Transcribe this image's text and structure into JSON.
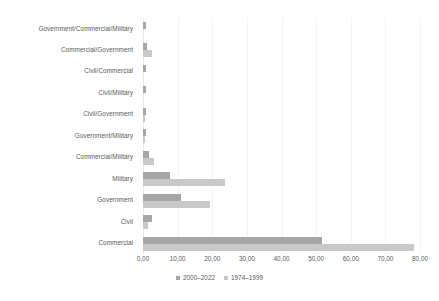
{
  "chart_data": {
    "type": "bar",
    "orientation": "horizontal",
    "title": "",
    "subtitle": "",
    "xlabel": "",
    "ylabel": "",
    "xlim": [
      0,
      80
    ],
    "xticks": [
      0,
      10,
      20,
      30,
      40,
      50,
      60,
      70,
      80
    ],
    "xtick_labels": [
      "0,00",
      "10,00",
      "20,00",
      "30,00",
      "40,00",
      "50,00",
      "60,00",
      "70,00",
      "80,00"
    ],
    "grid": true,
    "grid_axis": "x",
    "legend_position": "bottom-center",
    "categories": [
      "Government/Commercial/Military",
      "Commercial/Government",
      "Civil/Commercial",
      "Civil/Military",
      "Civil/Government",
      "Government/Military",
      "Commercial/Military",
      "Military",
      "Government",
      "Civil",
      "Commercial"
    ],
    "series": [
      {
        "name": "2000–2022",
        "color": "#a6a6a6",
        "values": [
          1.0,
          1.2,
          1.0,
          1.0,
          1.0,
          1.0,
          1.6,
          7.8,
          11.0,
          2.6,
          51.8
        ]
      },
      {
        "name": "1974–1999",
        "color": "#c9c9c9",
        "values": [
          0.0,
          2.6,
          0.0,
          0.0,
          0.5,
          0.5,
          3.1,
          23.6,
          19.4,
          1.3,
          78.3
        ]
      }
    ]
  },
  "legend": {
    "items": [
      {
        "label": "2000–2022",
        "color": "#a6a6a6"
      },
      {
        "label": "1974–1999",
        "color": "#c9c9c9"
      }
    ]
  },
  "colors": {
    "series_a": "#a6a6a6",
    "series_b": "#c9c9c9",
    "gridline": "#f2f2f2",
    "text": "#5a5a5a",
    "background": "#ffffff"
  }
}
